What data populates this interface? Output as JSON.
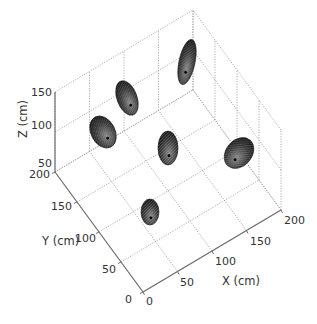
{
  "chart_data": {
    "type": "scatter3d",
    "title": "",
    "xlabel": "X (cm)",
    "ylabel": "Y (cm)",
    "zlabel": "Z (cm)",
    "xlim": [
      0,
      200
    ],
    "ylim": [
      0,
      200
    ],
    "zlim": [
      50,
      150
    ],
    "xticks": [
      "0",
      "50",
      "100",
      "150",
      "200"
    ],
    "yticks": [
      "0",
      "50",
      "100",
      "150",
      "200"
    ],
    "zticks": [
      "50",
      "100",
      "150"
    ],
    "grid": true,
    "marker": "ellipsoid (dark gray mesh)",
    "points": [
      {
        "id": 1,
        "x": 30,
        "y": 150,
        "z": 95
      },
      {
        "id": 2,
        "x": 55,
        "y": 165,
        "z": 120
      },
      {
        "id": 3,
        "x": 130,
        "y": 165,
        "z": 130
      },
      {
        "id": 4,
        "x": 95,
        "y": 110,
        "z": 80
      },
      {
        "id": 5,
        "x": 165,
        "y": 75,
        "z": 85
      },
      {
        "id": 6,
        "x": 55,
        "y": 75,
        "z": 50
      }
    ]
  },
  "labels": {
    "x_axis": "X (cm)",
    "y_axis": "Y (cm)",
    "z_axis": "Z (cm)",
    "x_ticks": [
      "0",
      "50",
      "100",
      "150",
      "200"
    ],
    "y_ticks": [
      "0",
      "50",
      "100",
      "150",
      "200"
    ],
    "z_ticks": [
      "50",
      "100",
      "150"
    ]
  },
  "colors": {
    "marker_dark": "#1a1a1a",
    "marker_light": "#9a9a9a",
    "grid": "#9a9a9a",
    "axis": "#6e6e6e",
    "text": "#333333"
  }
}
